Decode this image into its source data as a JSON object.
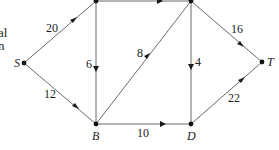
{
  "diagram": {
    "type": "flow-network",
    "cut_text": [
      "al",
      "n"
    ],
    "nodes": [
      {
        "id": "S",
        "label": "S",
        "x": 24,
        "y": 63
      },
      {
        "id": "A",
        "label": "",
        "x": 96,
        "y": 1
      },
      {
        "id": "C",
        "label": "",
        "x": 191,
        "y": 1
      },
      {
        "id": "T",
        "label": "T",
        "x": 262,
        "y": 62
      },
      {
        "id": "B",
        "label": "B",
        "x": 96,
        "y": 124
      },
      {
        "id": "D",
        "label": "D",
        "x": 191,
        "y": 124
      }
    ],
    "edges": [
      {
        "from": "S",
        "to": "A",
        "weight": "20"
      },
      {
        "from": "S",
        "to": "B",
        "weight": "12"
      },
      {
        "from": "A",
        "to": "C",
        "weight": ""
      },
      {
        "from": "A",
        "to": "B",
        "weight": "6"
      },
      {
        "from": "B",
        "to": "C",
        "weight": "8"
      },
      {
        "from": "C",
        "to": "D",
        "weight": "4"
      },
      {
        "from": "C",
        "to": "T",
        "weight": "16"
      },
      {
        "from": "B",
        "to": "D",
        "weight": "10"
      },
      {
        "from": "D",
        "to": "T",
        "weight": "22"
      }
    ]
  }
}
